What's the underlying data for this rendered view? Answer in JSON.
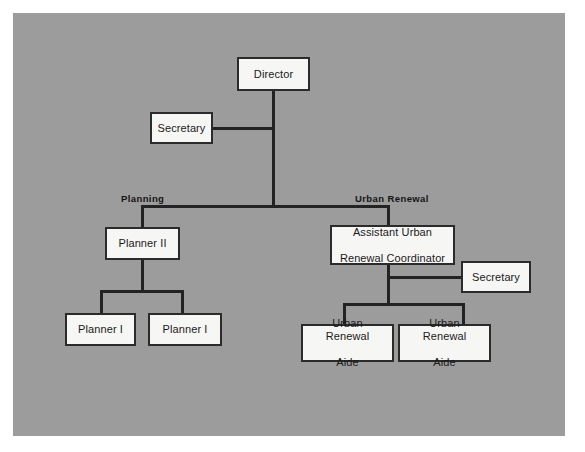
{
  "diagram": {
    "type": "organizational-chart",
    "panel_color": "#9c9c9c",
    "node_fill": "#f6f6f4",
    "node_border": "#2b2b2b",
    "line_color": "#232323",
    "nodes": [
      {
        "id": "director",
        "label": "Director",
        "level": 0
      },
      {
        "id": "secretary-director",
        "label": "Secretary",
        "level": 1
      },
      {
        "id": "planner-ii",
        "label": "Planner II",
        "level": 2
      },
      {
        "id": "assistant-urban-renewal-coordinator",
        "label": "Assistant Urban\nRenewal Coordinator",
        "line1": "Assistant Urban",
        "line2": "Renewal Coordinator",
        "level": 2
      },
      {
        "id": "secretary-urban-renewal",
        "label": "Secretary",
        "level": 3
      },
      {
        "id": "planner-i-left",
        "label": "Planner I",
        "level": 3
      },
      {
        "id": "planner-i-right",
        "label": "Planner I",
        "level": 3
      },
      {
        "id": "urban-renewal-aide-left",
        "label": "Urban Renewal\nAide",
        "line1": "Urban Renewal",
        "line2": "Aide",
        "level": 3
      },
      {
        "id": "urban-renewal-aide-right",
        "label": "Urban Renewal\nAide",
        "line1": "Urban Renewal",
        "line2": "Aide",
        "level": 3
      }
    ],
    "group_labels": [
      {
        "id": "planning",
        "label": "Planning"
      },
      {
        "id": "urban-renewal",
        "label": "Urban Renewal"
      }
    ]
  }
}
